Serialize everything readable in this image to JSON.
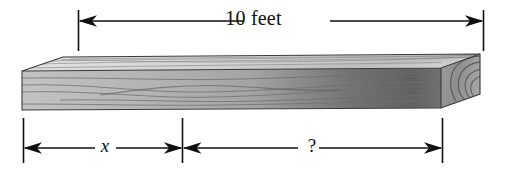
{
  "figure": {
    "type": "geometry-diagram",
    "top_dimension": {
      "label": "10 feet",
      "name": "total-length",
      "value": 10,
      "unit": "feet"
    },
    "bottom_dimensions": [
      {
        "label": "x",
        "name": "segment-x",
        "value": null,
        "unit": "feet"
      },
      {
        "label": "?",
        "name": "segment-unknown",
        "value": null,
        "unit": "feet"
      }
    ],
    "colors": {
      "line": "#101010",
      "board_front_light": "#b9b9b9",
      "board_front_dark": "#5d5d5d",
      "board_top_light": "#e2e2e2",
      "board_top_dark": "#c3c3c3",
      "board_end": "#8e8e8e",
      "grain": "#7d7d7d",
      "background": "#ffffff"
    }
  }
}
